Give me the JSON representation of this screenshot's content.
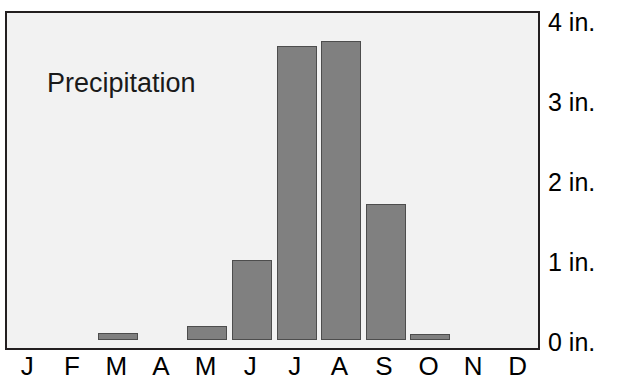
{
  "chart_data": {
    "type": "bar",
    "title": "Precipitation",
    "xlabel": "",
    "ylabel": "",
    "categories": [
      "J",
      "F",
      "M",
      "A",
      "M",
      "J",
      "J",
      "A",
      "S",
      "O",
      "N",
      "D"
    ],
    "category_names": [
      "January",
      "February",
      "March",
      "April",
      "May",
      "June",
      "July",
      "August",
      "September",
      "October",
      "November",
      "December"
    ],
    "values": [
      0,
      0,
      0.09,
      0,
      0.18,
      1.0,
      3.68,
      3.74,
      1.7,
      0.08,
      0,
      0
    ],
    "ylim": [
      0,
      4.25
    ],
    "yticks": [
      0,
      1,
      2,
      3,
      4
    ],
    "ytick_labels": [
      "0 in.",
      "1 in.",
      "2 in.",
      "3 in.",
      "4 in."
    ],
    "grid": false,
    "legend": null,
    "unit": "in.",
    "colors": {
      "bar_fill": "#808080",
      "bar_edge": "#4d4d4d",
      "plot_background": "#f2f2f2",
      "frame": "#231f20",
      "text": "#000000",
      "title_text": "#1a1a1a"
    }
  }
}
